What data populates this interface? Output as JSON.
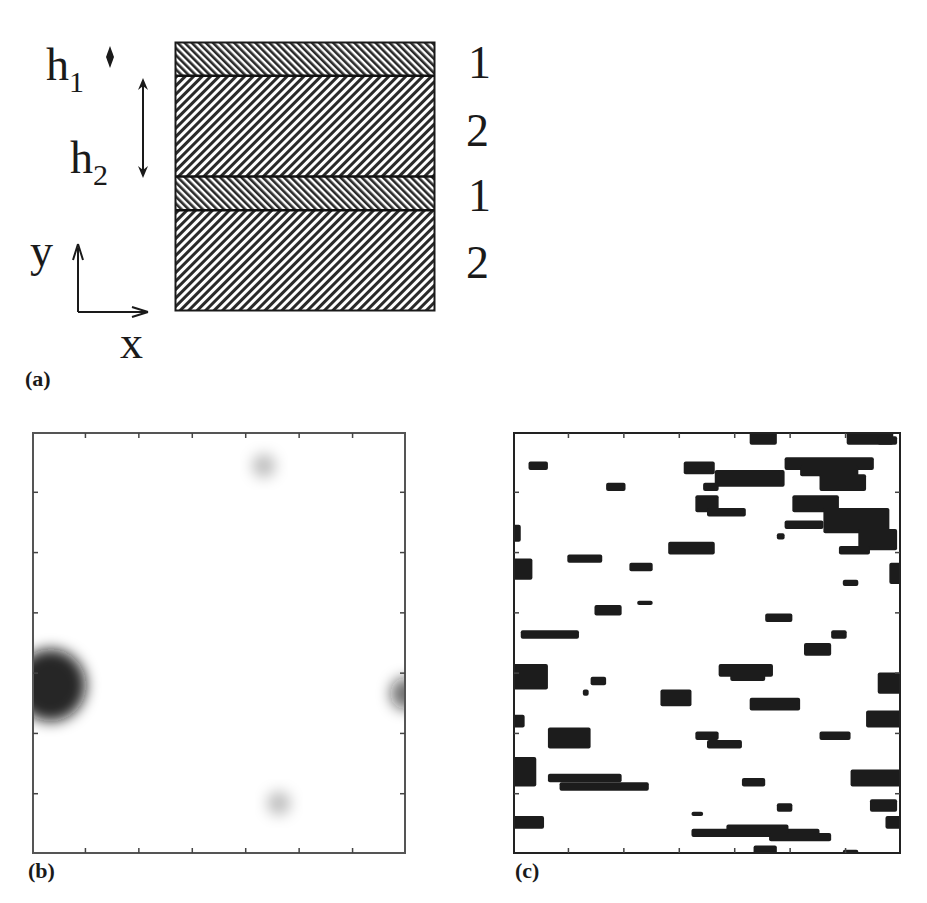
{
  "figure": {
    "panel_a": {
      "tag": "(a)",
      "h1_label": "h",
      "h1_sub": "1",
      "h2_label": "h",
      "h2_sub": "2",
      "y_axis_label": "y",
      "x_axis_label": "x",
      "layer_labels": [
        "1",
        "2",
        "1",
        "2"
      ],
      "layers": [
        {
          "material": "1",
          "relative_thickness": 1,
          "hatch": "dense-right"
        },
        {
          "material": "2",
          "relative_thickness": 3,
          "hatch": "dense-left"
        },
        {
          "material": "1",
          "relative_thickness": 1,
          "hatch": "dense-right"
        },
        {
          "material": "2",
          "relative_thickness": 3,
          "hatch": "dense-left"
        }
      ]
    },
    "panel_b": {
      "tag": "(b)",
      "description": "grayscale intensity map",
      "ticks_per_side": 7,
      "spots": [
        {
          "cx": 0.05,
          "cy": 0.6,
          "r": 0.09,
          "intensity": 0.9
        },
        {
          "cx": 1.0,
          "cy": 0.62,
          "r": 0.04,
          "intensity": 0.6
        },
        {
          "cx": 0.62,
          "cy": 0.08,
          "r": 0.03,
          "intensity": 0.25
        },
        {
          "cx": 0.66,
          "cy": 0.88,
          "r": 0.03,
          "intensity": 0.25
        }
      ]
    },
    "panel_c": {
      "tag": "(c)",
      "description": "binary cluster map",
      "ticks_per_side": 7,
      "clusters": [
        [
          0.61,
          0.0,
          0.07,
          0.03
        ],
        [
          0.86,
          0.0,
          0.12,
          0.03
        ],
        [
          0.94,
          0.01,
          0.05,
          0.02
        ],
        [
          0.04,
          0.07,
          0.05,
          0.02
        ],
        [
          0.44,
          0.07,
          0.08,
          0.03
        ],
        [
          0.7,
          0.06,
          0.23,
          0.03
        ],
        [
          0.74,
          0.08,
          0.15,
          0.025
        ],
        [
          0.52,
          0.09,
          0.18,
          0.04
        ],
        [
          0.49,
          0.12,
          0.04,
          0.02
        ],
        [
          0.24,
          0.12,
          0.05,
          0.02
        ],
        [
          0.79,
          0.1,
          0.12,
          0.04
        ],
        [
          0.47,
          0.15,
          0.06,
          0.04
        ],
        [
          0.5,
          0.18,
          0.1,
          0.02
        ],
        [
          0.72,
          0.15,
          0.12,
          0.04
        ],
        [
          0.8,
          0.18,
          0.17,
          0.06
        ],
        [
          0.7,
          0.21,
          0.1,
          0.02
        ],
        [
          0.89,
          0.23,
          0.1,
          0.05
        ],
        [
          0.84,
          0.27,
          0.08,
          0.02
        ],
        [
          0.68,
          0.24,
          0.02,
          0.015
        ],
        [
          0.0,
          0.22,
          0.02,
          0.04
        ],
        [
          0.0,
          0.3,
          0.05,
          0.05
        ],
        [
          0.4,
          0.26,
          0.12,
          0.03
        ],
        [
          0.14,
          0.29,
          0.09,
          0.02
        ],
        [
          0.3,
          0.31,
          0.06,
          0.02
        ],
        [
          0.97,
          0.31,
          0.03,
          0.05
        ],
        [
          0.85,
          0.35,
          0.04,
          0.015
        ],
        [
          0.32,
          0.4,
          0.04,
          0.01
        ],
        [
          0.21,
          0.41,
          0.07,
          0.025
        ],
        [
          0.65,
          0.43,
          0.07,
          0.02
        ],
        [
          0.02,
          0.47,
          0.15,
          0.02
        ],
        [
          0.82,
          0.47,
          0.04,
          0.02
        ],
        [
          0.75,
          0.5,
          0.07,
          0.03
        ],
        [
          0.0,
          0.55,
          0.09,
          0.06
        ],
        [
          0.2,
          0.58,
          0.04,
          0.02
        ],
        [
          0.18,
          0.61,
          0.015,
          0.015
        ],
        [
          0.38,
          0.61,
          0.08,
          0.04
        ],
        [
          0.53,
          0.55,
          0.14,
          0.03
        ],
        [
          0.56,
          0.57,
          0.09,
          0.02
        ],
        [
          0.61,
          0.63,
          0.13,
          0.03
        ],
        [
          0.94,
          0.57,
          0.06,
          0.05
        ],
        [
          0.0,
          0.67,
          0.03,
          0.03
        ],
        [
          0.91,
          0.66,
          0.09,
          0.04
        ],
        [
          0.09,
          0.7,
          0.11,
          0.05
        ],
        [
          0.47,
          0.71,
          0.06,
          0.02
        ],
        [
          0.5,
          0.73,
          0.09,
          0.02
        ],
        [
          0.79,
          0.71,
          0.08,
          0.02
        ],
        [
          0.0,
          0.77,
          0.06,
          0.07
        ],
        [
          0.09,
          0.81,
          0.19,
          0.02
        ],
        [
          0.12,
          0.83,
          0.23,
          0.02
        ],
        [
          0.59,
          0.82,
          0.06,
          0.02
        ],
        [
          0.87,
          0.8,
          0.13,
          0.04
        ],
        [
          0.92,
          0.87,
          0.07,
          0.03
        ],
        [
          0.68,
          0.88,
          0.04,
          0.02
        ],
        [
          0.46,
          0.9,
          0.03,
          0.01
        ],
        [
          0.0,
          0.91,
          0.08,
          0.03
        ],
        [
          0.96,
          0.91,
          0.04,
          0.03
        ],
        [
          0.46,
          0.94,
          0.33,
          0.02
        ],
        [
          0.55,
          0.93,
          0.16,
          0.02
        ],
        [
          0.66,
          0.95,
          0.16,
          0.02
        ],
        [
          0.62,
          0.98,
          0.06,
          0.02
        ],
        [
          0.85,
          0.99,
          0.04,
          0.01
        ]
      ]
    }
  }
}
